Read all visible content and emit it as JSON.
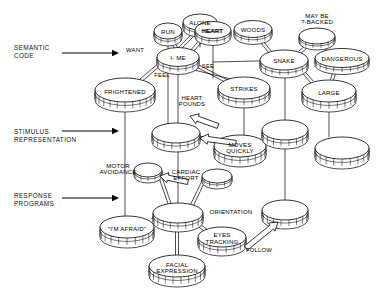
{
  "figure": {
    "type": "semantic-network-diagram",
    "background": "#ffffff",
    "ink": "#000000"
  },
  "levels": [
    {
      "id": "semantic-code",
      "line1": "SEMANTIC",
      "line2": "CODE",
      "x": 14,
      "y": 44,
      "arrow_x1": 62,
      "arrow_x2": 118,
      "arrow_y": 53
    },
    {
      "id": "stimulus-representation",
      "line1": "STIMULUS",
      "line2": "REPRESENTATION",
      "x": 14,
      "y": 128,
      "arrow_x1": 62,
      "arrow_x2": 118,
      "arrow_y": 131
    },
    {
      "id": "response-programs",
      "line1": "RESPONSE",
      "line2": "PROGRAMS",
      "x": 14,
      "y": 192,
      "arrow_x1": 62,
      "arrow_x2": 118,
      "arrow_y": 198
    }
  ],
  "nodes": [
    {
      "id": "run",
      "label": "RUN",
      "lines": [
        "RUN"
      ],
      "cx": 168,
      "cy": 31,
      "rx": 14,
      "ry": 8,
      "h": 7
    },
    {
      "id": "alone",
      "label": "ALONE",
      "lines": [
        "ALONE"
      ],
      "cx": 200,
      "cy": 22,
      "rx": 17,
      "ry": 8,
      "h": 7
    },
    {
      "id": "heart",
      "label": "HEART",
      "lines": [
        "HEART"
      ],
      "cx": 212,
      "cy": 31,
      "rx": 0,
      "ry": 0,
      "h": 0,
      "hidden": true
    },
    {
      "id": "heart-top",
      "label": "HEART",
      "lines": [
        "HEART"
      ],
      "cx": 213,
      "cy": 30,
      "rx": 18,
      "ry": 8.5,
      "h": 7
    },
    {
      "id": "woods",
      "label": "WOODS",
      "lines": [
        "WOODS"
      ],
      "cx": 253,
      "cy": 29,
      "rx": 19,
      "ry": 8.5,
      "h": 7
    },
    {
      "id": "may-be-backed",
      "label": "MAY BE ?-BACKED",
      "lines": [
        "MAY BE",
        "?-BACKED"
      ],
      "cx": 317,
      "cy": 36,
      "rx": 18,
      "ry": 8,
      "h": 6,
      "label_above": true
    },
    {
      "id": "i-me",
      "label": "I- ME",
      "lines": [
        "I- ME"
      ],
      "cx": 178,
      "cy": 57,
      "rx": 21,
      "ry": 9.5,
      "h": 8
    },
    {
      "id": "snake",
      "label": "SNAKE",
      "lines": [
        "SNAKE"
      ],
      "cx": 284,
      "cy": 60,
      "rx": 24,
      "ry": 10,
      "h": 8
    },
    {
      "id": "dangerous",
      "label": "DANGEROUS",
      "lines": [
        "DANGEROUS"
      ],
      "cx": 342,
      "cy": 58,
      "rx": 27,
      "ry": 9.5,
      "h": 7
    },
    {
      "id": "frightened",
      "label": "FRIGHTENED",
      "lines": [
        "FRIGHTENED"
      ],
      "cx": 125,
      "cy": 90,
      "rx": 30,
      "ry": 12,
      "h": 10
    },
    {
      "id": "strikes",
      "label": "STRIKES",
      "lines": [
        "STRIKES"
      ],
      "cx": 244,
      "cy": 88,
      "rx": 26,
      "ry": 11,
      "h": 9
    },
    {
      "id": "large",
      "label": "LARGE",
      "lines": [
        "LARGE"
      ],
      "cx": 329,
      "cy": 91,
      "rx": 27,
      "ry": 11,
      "h": 10
    },
    {
      "id": "stim-left",
      "label": "",
      "lines": [],
      "cx": 176,
      "cy": 133,
      "rx": 24,
      "ry": 10,
      "h": 9
    },
    {
      "id": "moves-quickly",
      "label": "MOVES QUICKLY",
      "lines": [
        "MOVES",
        "QUICKLY"
      ],
      "cx": 240,
      "cy": 146,
      "rx": 26,
      "ry": 11,
      "h": 10
    },
    {
      "id": "stim-mid",
      "label": "",
      "lines": [],
      "cx": 285,
      "cy": 130,
      "rx": 23,
      "ry": 10,
      "h": 9
    },
    {
      "id": "stim-right",
      "label": "",
      "lines": [],
      "cx": 342,
      "cy": 148,
      "rx": 27,
      "ry": 11,
      "h": 10
    },
    {
      "id": "motor-avoidance",
      "label": "MOTOR AVOIDANCE",
      "lines": [
        "MOTOR",
        "AVOIDANCE"
      ],
      "cx": 148,
      "cy": 170,
      "rx": 14,
      "ry": 7,
      "h": 6,
      "label_left": true
    },
    {
      "id": "cardiac-effort",
      "label": "CARDIAC EFFORT",
      "lines": [
        "CARDIAC",
        "EFFORT"
      ],
      "cx": 217,
      "cy": 176,
      "rx": 15,
      "ry": 7,
      "h": 6,
      "label_left": true
    },
    {
      "id": "orientation",
      "label": "ORIENTATION",
      "lines": [
        "ORIENTATION"
      ],
      "cx": 178,
      "cy": 213,
      "rx": 25,
      "ry": 10,
      "h": 9,
      "label_right": true
    },
    {
      "id": "im-afraid",
      "label": "\"I'M AFRAID\"",
      "lines": [
        "\"I'M AFRAID\""
      ],
      "cx": 127,
      "cy": 227,
      "rx": 27,
      "ry": 11,
      "h": 10
    },
    {
      "id": "eyes-tracking",
      "label": "EYES TRACKING",
      "lines": [
        "EYES",
        "TRACKING"
      ],
      "cx": 222,
      "cy": 237,
      "rx": 24,
      "ry": 10,
      "h": 9
    },
    {
      "id": "facial-expression",
      "label": "FACIAL EXPRESSION",
      "lines": [
        "FACIAL",
        "EXPRESSION"
      ],
      "cx": 177,
      "cy": 266,
      "rx": 28,
      "ry": 11,
      "h": 10
    },
    {
      "id": "resp-right",
      "label": "",
      "lines": [],
      "cx": 285,
      "cy": 210,
      "rx": 23,
      "ry": 10,
      "h": 9
    }
  ],
  "edge_labels": [
    {
      "id": "want",
      "text": "WANT",
      "x": 135,
      "y": 50
    },
    {
      "id": "feel",
      "text": "FEEL",
      "x": 162,
      "y": 75
    },
    {
      "id": "see",
      "text": "SEE",
      "x": 208,
      "y": 66
    },
    {
      "id": "heart-pounds",
      "text": "HEART POUNDS",
      "lines": [
        "HEART",
        "POUNDS"
      ],
      "x": 192,
      "y": 101
    },
    {
      "id": "follow",
      "text": "FOLLOW",
      "x": 259,
      "y": 250
    }
  ],
  "single_lines": [
    {
      "x1": 168,
      "y1": 39,
      "x2": 168,
      "y2": 128
    },
    {
      "x1": 200,
      "y1": 30,
      "x2": 200,
      "y2": 47
    },
    {
      "x1": 213,
      "y1": 39,
      "x2": 213,
      "y2": 78
    },
    {
      "x1": 178,
      "y1": 67,
      "x2": 178,
      "y2": 123
    },
    {
      "x1": 178,
      "y1": 142,
      "x2": 178,
      "y2": 203
    },
    {
      "x1": 244,
      "y1": 99,
      "x2": 244,
      "y2": 135
    },
    {
      "x1": 285,
      "y1": 70,
      "x2": 285,
      "y2": 120
    },
    {
      "x1": 285,
      "y1": 140,
      "x2": 285,
      "y2": 200
    },
    {
      "x1": 329,
      "y1": 102,
      "x2": 329,
      "y2": 137
    },
    {
      "x1": 125,
      "y1": 102,
      "x2": 125,
      "y2": 216
    },
    {
      "x1": 186,
      "y1": 68,
      "x2": 235,
      "y2": 80
    },
    {
      "x1": 213,
      "y1": 62,
      "x2": 300,
      "y2": 60
    }
  ],
  "double_lines": [
    {
      "x1": 178,
      "y1": 50,
      "x2": 168,
      "y2": 37
    },
    {
      "x1": 180,
      "y1": 48,
      "x2": 198,
      "y2": 30
    },
    {
      "x1": 191,
      "y1": 52,
      "x2": 205,
      "y2": 36
    },
    {
      "x1": 160,
      "y1": 64,
      "x2": 140,
      "y2": 81
    },
    {
      "x1": 192,
      "y1": 63,
      "x2": 228,
      "y2": 82
    },
    {
      "x1": 270,
      "y1": 52,
      "x2": 258,
      "y2": 37
    },
    {
      "x1": 300,
      "y1": 52,
      "x2": 312,
      "y2": 42
    },
    {
      "x1": 328,
      "y1": 49,
      "x2": 322,
      "y2": 44
    },
    {
      "x1": 336,
      "y1": 67,
      "x2": 332,
      "y2": 80
    },
    {
      "x1": 300,
      "y1": 68,
      "x2": 312,
      "y2": 82
    },
    {
      "x1": 264,
      "y1": 142,
      "x2": 278,
      "y2": 136
    },
    {
      "x1": 198,
      "y1": 137,
      "x2": 218,
      "y2": 142
    },
    {
      "x1": 160,
      "y1": 176,
      "x2": 170,
      "y2": 205
    },
    {
      "x1": 204,
      "y1": 180,
      "x2": 192,
      "y2": 205
    },
    {
      "x1": 152,
      "y1": 220,
      "x2": 162,
      "y2": 214
    },
    {
      "x1": 192,
      "y1": 220,
      "x2": 208,
      "y2": 232
    },
    {
      "x1": 177,
      "y1": 223,
      "x2": 177,
      "y2": 256
    }
  ],
  "block_arrows": [
    {
      "id": "arrow-heart-pounds",
      "from": [
        218,
        126
      ],
      "to": [
        190,
        116
      ],
      "desc": "up-left to stim-left node"
    },
    {
      "id": "arrow-to-stim-left",
      "from": [
        236,
        143
      ],
      "to": [
        200,
        138
      ],
      "desc": "left into stim-left"
    },
    {
      "id": "arrow-cardiac",
      "from": [
        188,
        182
      ],
      "to": [
        160,
        176
      ],
      "desc": "left toward motor avoidance"
    },
    {
      "id": "arrow-follow",
      "from": [
        246,
        248
      ],
      "to": [
        278,
        222
      ],
      "desc": "right-up toward resp-right"
    }
  ]
}
